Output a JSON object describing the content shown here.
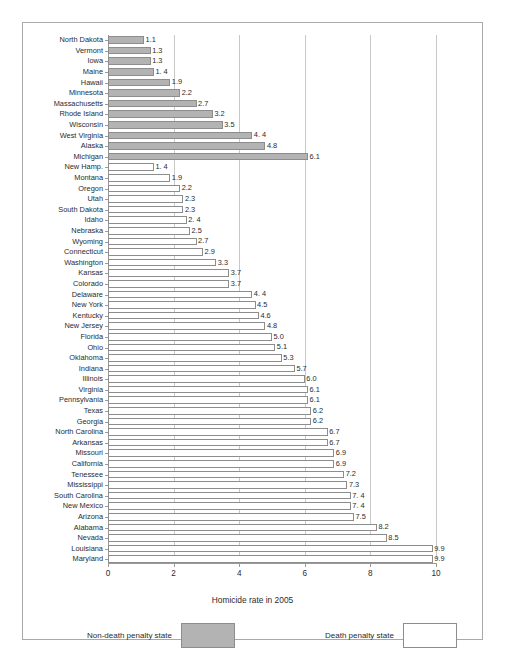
{
  "page_header": "",
  "chart_data": {
    "type": "bar",
    "orientation": "horizontal",
    "title": "",
    "xlabel": "Homicide rate in 2005",
    "ylabel": "",
    "xlim": [
      0,
      10
    ],
    "xticks": [
      0,
      2,
      4,
      6,
      8,
      10
    ],
    "grid": true,
    "legend_position": "bottom",
    "categories": [
      "North Dakota",
      "Vermont",
      "Iowa",
      "Maine",
      "Hawaii",
      "Minnesota",
      "Massachusetts",
      "Rhode Island",
      "Wisconsin",
      "West Virginia",
      "Alaska",
      "Michigan",
      "New Hamp.",
      "Montana",
      "Oregon",
      "Utah",
      "South Dakota",
      "Idaho",
      "Nebraska",
      "Wyoming",
      "Connecticut",
      "Washington",
      "Kansas",
      "Colorado",
      "Delaware",
      "New York",
      "Kentucky",
      "New Jersey",
      "Florida",
      "Ohio",
      "Oklahoma",
      "Indiana",
      "Illinois",
      "Virginia",
      "Pennsylvania",
      "Texas",
      "Georgia",
      "North Carolina",
      "Arkansas",
      "Missouri",
      "California",
      "Tenessee",
      "Mississippi",
      "South Carolina",
      "New Mexico",
      "Arizona",
      "Alabama",
      "Nevada",
      "Louisiana",
      "Maryland"
    ],
    "values": [
      1.1,
      1.3,
      1.3,
      1.4,
      1.9,
      2.2,
      2.7,
      3.2,
      3.5,
      4.4,
      4.8,
      6.1,
      1.4,
      1.9,
      2.2,
      2.3,
      2.3,
      2.4,
      2.5,
      2.7,
      2.9,
      3.3,
      3.7,
      3.7,
      4.4,
      4.5,
      4.6,
      4.8,
      5.0,
      5.1,
      5.3,
      5.7,
      6.0,
      6.1,
      6.1,
      6.2,
      6.2,
      6.7,
      6.7,
      6.9,
      6.9,
      7.2,
      7.3,
      7.4,
      7.4,
      7.5,
      8.2,
      8.5,
      9.9,
      9.9
    ],
    "value_labels": [
      "1.1",
      "1.3",
      "1.3",
      "1. 4",
      "1.9",
      "2.2",
      "2.7",
      "3.2",
      "3.5",
      "4. 4",
      "4.8",
      "6.1",
      "1. 4",
      "1.9",
      "2.2",
      "2.3",
      "2.3",
      "2. 4",
      "2.5",
      "2.7",
      "2.9",
      "3.3",
      "3.7",
      "3.7",
      "4. 4",
      "4.5",
      "4.6",
      "4.8",
      "5.0",
      "5.1",
      "5.3",
      "5.7",
      "6.0",
      "6.1",
      "6.1",
      "6.2",
      "6.2",
      "6.7",
      "6.7",
      "6.9",
      "6.9",
      "7.2",
      "7.3",
      "7. 4",
      "7. 4",
      "7.5",
      "8.2",
      "8.5",
      "9.9",
      "9.9"
    ],
    "groups": [
      "non-death-penalty",
      "non-death-penalty",
      "non-death-penalty",
      "non-death-penalty",
      "non-death-penalty",
      "non-death-penalty",
      "non-death-penalty",
      "non-death-penalty",
      "non-death-penalty",
      "non-death-penalty",
      "non-death-penalty",
      "non-death-penalty",
      "death-penalty",
      "death-penalty",
      "death-penalty",
      "death-penalty",
      "death-penalty",
      "death-penalty",
      "death-penalty",
      "death-penalty",
      "death-penalty",
      "death-penalty",
      "death-penalty",
      "death-penalty",
      "death-penalty",
      "death-penalty",
      "death-penalty",
      "death-penalty",
      "death-penalty",
      "death-penalty",
      "death-penalty",
      "death-penalty",
      "death-penalty",
      "death-penalty",
      "death-penalty",
      "death-penalty",
      "death-penalty",
      "death-penalty",
      "death-penalty",
      "death-penalty",
      "death-penalty",
      "death-penalty",
      "death-penalty",
      "death-penalty",
      "death-penalty",
      "death-penalty",
      "death-penalty",
      "death-penalty",
      "death-penalty",
      "death-penalty"
    ],
    "legend": [
      {
        "label": "Non-death penalty state",
        "key": "non-death-penalty",
        "color": "#b3b3b3"
      },
      {
        "label": "Death penalty state",
        "key": "death-penalty",
        "color": "#ffffff"
      }
    ]
  },
  "colors": {
    "non_death_penalty_fill": "#b3b3b3",
    "death_penalty_fill": "#ffffff",
    "bar_stroke": "#8d8d8d",
    "grid": "#c8c8c8",
    "axis": "#9a9a9a",
    "text": "#2b2b2b",
    "frame": "#a9a9a9"
  }
}
